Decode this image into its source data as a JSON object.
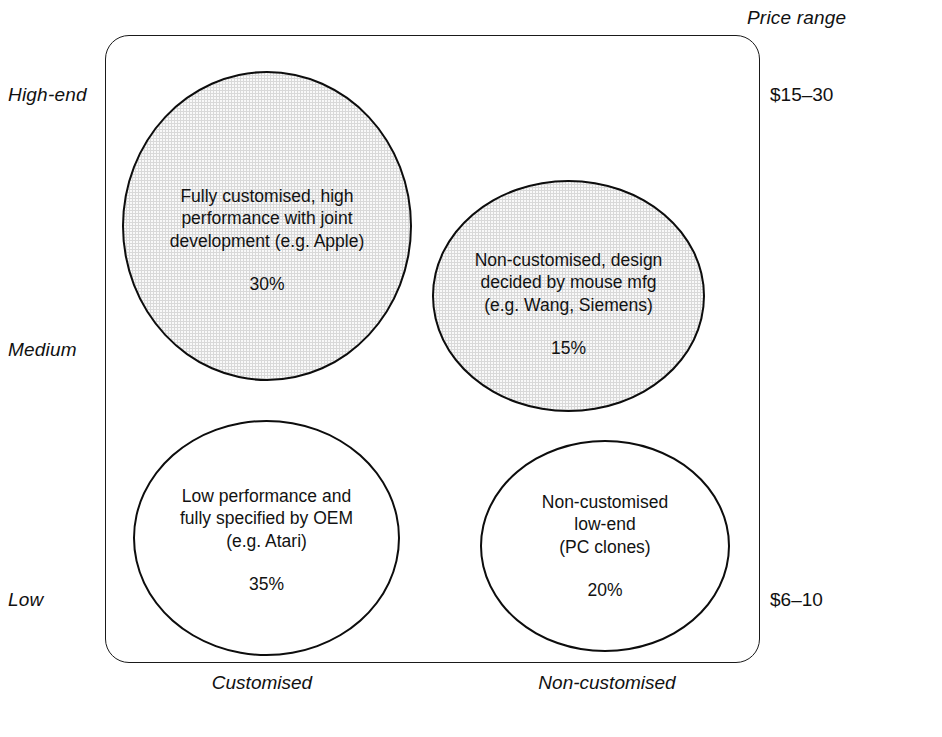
{
  "chart_data": {
    "type": "scatter",
    "title": "",
    "xlabel": "",
    "ylabel": "",
    "axis": {
      "y_ticks": [
        "High-end",
        "Medium",
        "Low"
      ],
      "x_ticks": [
        "Customised",
        "Non-customised"
      ],
      "secondary_axis_title": "Price range",
      "secondary_ticks": [
        "$15–30",
        "$6–10"
      ],
      "grid": false,
      "legend": "none"
    },
    "categories": [
      "Fully customised, high performance with joint development (e.g. Apple)",
      "Non-customised, design decided by mouse mfg (e.g. Wang, Siemens)",
      "Low performance and fully specified by OEM (e.g. Atari)",
      "Non-customised low-end (PC clones)"
    ],
    "values": [
      30,
      15,
      35,
      20
    ],
    "bubbles": [
      {
        "id": "bubble-1",
        "description": "Fully customised, high\nperformance with joint\ndevelopment (e.g. Apple)",
        "percent": "30%",
        "value": 30,
        "x_position": "Customised",
        "y_position": "High-end",
        "price_range": "$15–30",
        "shaded": true,
        "fill": "#d9d9d9"
      },
      {
        "id": "bubble-2",
        "description": "Non-customised, design\ndecided by mouse mfg\n(e.g. Wang, Siemens)",
        "percent": "15%",
        "value": 15,
        "x_position": "Non-customised",
        "y_position": "High-end to Medium",
        "price_range": "$15–30",
        "shaded": true,
        "fill": "#d9d9d9"
      },
      {
        "id": "bubble-3",
        "description": "Low performance and\nfully specified by OEM\n(e.g. Atari)",
        "percent": "35%",
        "value": 35,
        "x_position": "Customised",
        "y_position": "Low",
        "price_range": "$6–10",
        "shaded": false,
        "fill": "#ffffff"
      },
      {
        "id": "bubble-4",
        "description": "Non-customised\nlow-end\n(PC clones)",
        "percent": "20%",
        "value": 20,
        "x_position": "Non-customised",
        "y_position": "Low",
        "price_range": "$6–10",
        "shaded": false,
        "fill": "#ffffff"
      }
    ]
  },
  "labels": {
    "y_high": "High-end",
    "y_medium": "Medium",
    "y_low": "Low",
    "x_left": "Customised",
    "x_right": "Non-customised",
    "price_range_title": "Price range",
    "price_high": "$15–30",
    "price_low": "$6–10"
  }
}
